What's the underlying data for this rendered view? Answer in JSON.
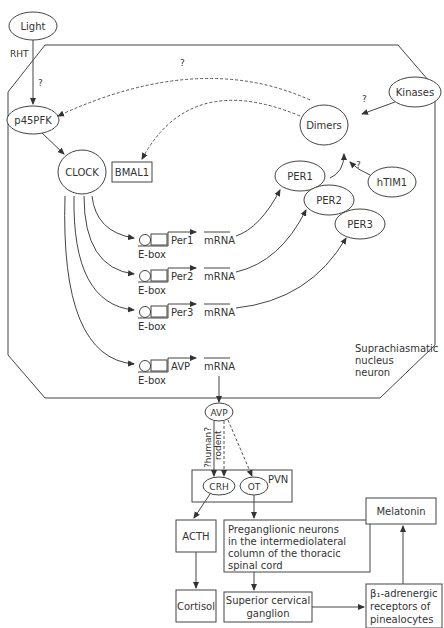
{
  "diagram": {
    "nodes": {
      "light": "Light",
      "rht": "RHT",
      "q_light": "?",
      "p45pfk": "p45PFK",
      "clock": "CLOCK",
      "bmal1": "BMAL1",
      "dimers": "Dimers",
      "kinases": "Kinases",
      "q_kinases": "?",
      "htim1": "hTIM1",
      "q_htim1": "?",
      "q_top": "?",
      "per1_prot": "PER1",
      "per2_prot": "PER2",
      "per3_prot": "PER3",
      "cell_label_1": "Suprachiasmatic",
      "cell_label_2": "nucleus",
      "cell_label_3": "neuron",
      "avp_prot": "AVP",
      "human_label": "?human?",
      "rodent_label": "rodent",
      "pvn": "PVN",
      "crh": "CRH",
      "ot": "OT",
      "acth": "ACTH",
      "cortisol": "Cortisol",
      "pregang_1": "Preganglionic neurons",
      "pregang_2": "in the intermediolateral",
      "pregang_3": "column of the thoracic",
      "pregang_4": "spinal cord",
      "scg_1": "Superior cervical",
      "scg_2": "ganglion",
      "beta_1": "β₁-adrenergic",
      "beta_2": "receptors of",
      "beta_3": "pinealocytes",
      "melatonin": "Melatonin"
    },
    "genes": [
      {
        "name": "Per1",
        "ebox": "E-box",
        "mrna": "mRNA"
      },
      {
        "name": "Per2",
        "ebox": "E-box",
        "mrna": "mRNA"
      },
      {
        "name": "Per3",
        "ebox": "E-box",
        "mrna": "mRNA"
      },
      {
        "name": "AVP",
        "ebox": "E-box",
        "mrna": "mRNA"
      }
    ]
  }
}
